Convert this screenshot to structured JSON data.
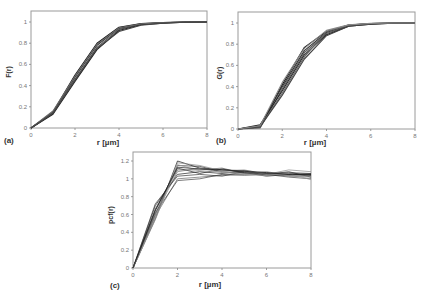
{
  "chart_data": [
    {
      "id": "a",
      "type": "line",
      "panel_label": "(a)",
      "title": "",
      "xlabel": "r [µm]",
      "ylabel": "F(r)",
      "xlim": [
        0,
        8
      ],
      "ylim": [
        0,
        1.1
      ],
      "xticks": [
        0,
        2,
        4,
        6,
        8
      ],
      "yticks": [
        0,
        0.2,
        0.4,
        0.6,
        0.8,
        1
      ],
      "ytick_labels": [
        "0",
        "0.2",
        "0.4",
        "0.6",
        "0.8",
        "1"
      ],
      "grid": false,
      "legend": "none",
      "x": [
        0,
        1,
        2,
        3,
        4,
        5,
        6,
        7,
        8
      ],
      "series": [
        {
          "name": "s1",
          "values": [
            0,
            0.15,
            0.5,
            0.8,
            0.95,
            0.985,
            0.995,
            1,
            1
          ]
        },
        {
          "name": "s2",
          "values": [
            0,
            0.14,
            0.48,
            0.78,
            0.94,
            0.98,
            0.993,
            1,
            1
          ]
        },
        {
          "name": "s3",
          "values": [
            0,
            0.15,
            0.46,
            0.76,
            0.93,
            0.978,
            0.992,
            0.999,
            1
          ]
        },
        {
          "name": "s4",
          "values": [
            0,
            0.13,
            0.44,
            0.74,
            0.92,
            0.975,
            0.99,
            0.998,
            1
          ]
        },
        {
          "name": "s5",
          "values": [
            0,
            0.16,
            0.49,
            0.79,
            0.945,
            0.982,
            0.994,
            1,
            1
          ]
        },
        {
          "name": "s6",
          "values": [
            0,
            0.14,
            0.45,
            0.75,
            0.91,
            0.97,
            0.99,
            0.998,
            1
          ]
        }
      ]
    },
    {
      "id": "b",
      "type": "line",
      "panel_label": "(b)",
      "title": "",
      "xlabel": "r [µm]",
      "ylabel": "G(r)",
      "xlim": [
        0,
        8
      ],
      "ylim": [
        0,
        1.1
      ],
      "xticks": [
        0,
        2,
        4,
        6,
        8
      ],
      "yticks": [
        0,
        0.2,
        0.4,
        0.6,
        0.8,
        1
      ],
      "ytick_labels": [
        "0",
        "0.2",
        "0.4",
        "0.6",
        "0.8",
        "1"
      ],
      "grid": false,
      "legend": "none",
      "x": [
        0,
        1,
        2,
        3,
        4,
        5,
        6,
        7,
        8
      ],
      "series": [
        {
          "name": "s1",
          "values": [
            0,
            0.02,
            0.42,
            0.77,
            0.92,
            0.98,
            0.995,
            1,
            1
          ]
        },
        {
          "name": "s2",
          "values": [
            0,
            0.03,
            0.4,
            0.74,
            0.91,
            0.978,
            0.994,
            1,
            1
          ]
        },
        {
          "name": "s3",
          "values": [
            0,
            0.01,
            0.38,
            0.72,
            0.9,
            0.975,
            0.993,
            0.999,
            1
          ]
        },
        {
          "name": "s4",
          "values": [
            0,
            0.04,
            0.36,
            0.7,
            0.89,
            0.97,
            0.99,
            0.998,
            1
          ]
        },
        {
          "name": "s5",
          "values": [
            0,
            0.02,
            0.34,
            0.68,
            0.92,
            0.98,
            0.995,
            1,
            1
          ]
        },
        {
          "name": "s6",
          "values": [
            0,
            0.02,
            0.32,
            0.66,
            0.88,
            0.97,
            0.99,
            0.998,
            1
          ]
        },
        {
          "name": "s7",
          "values": [
            0,
            0.03,
            0.44,
            0.76,
            0.93,
            0.982,
            0.996,
            1,
            1
          ]
        }
      ]
    },
    {
      "id": "c",
      "type": "line",
      "panel_label": "(c)",
      "title": "",
      "xlabel": "r [µm]",
      "ylabel": "pcf(r)",
      "xlim": [
        0,
        8
      ],
      "ylim": [
        0,
        1.3
      ],
      "xticks": [
        0,
        2,
        4,
        6,
        8
      ],
      "yticks": [
        0,
        0.2,
        0.4,
        0.6,
        0.8,
        1,
        1.2
      ],
      "ytick_labels": [
        "0",
        "0.2",
        "0.4",
        "0.6",
        "0.8",
        "1",
        "1.2"
      ],
      "grid": false,
      "legend": "none",
      "x": [
        0,
        1,
        2,
        3,
        4,
        5,
        6,
        7,
        8
      ],
      "series": [
        {
          "name": "s1",
          "values": [
            0,
            0.55,
            1.2,
            1.12,
            1.1,
            1.08,
            1.06,
            1.05,
            1.04
          ]
        },
        {
          "name": "s2",
          "values": [
            0,
            0.6,
            1.15,
            1.14,
            1.08,
            1.07,
            1.05,
            1.08,
            1.02
          ]
        },
        {
          "name": "s3",
          "values": [
            0,
            0.65,
            1.1,
            1.1,
            1.12,
            1.06,
            1.07,
            1.04,
            1.06
          ]
        },
        {
          "name": "s4",
          "values": [
            0,
            0.7,
            1.05,
            1.08,
            1.06,
            1.09,
            1.04,
            1.06,
            1.05
          ]
        },
        {
          "name": "s5",
          "values": [
            0,
            0.58,
            1.0,
            1.02,
            1.04,
            1.05,
            1.06,
            1.03,
            1.02
          ]
        },
        {
          "name": "s6",
          "values": [
            0,
            0.62,
            0.98,
            1.0,
            1.05,
            1.04,
            1.05,
            1.02,
            1.0
          ]
        },
        {
          "name": "s7",
          "values": [
            0,
            0.56,
            1.18,
            1.15,
            1.09,
            1.1,
            1.05,
            1.1,
            1.08
          ]
        },
        {
          "name": "s8",
          "values": [
            0,
            0.66,
            1.12,
            1.06,
            1.11,
            1.07,
            1.03,
            1.05,
            1.04
          ]
        },
        {
          "name": "s9",
          "values": [
            0,
            0.6,
            1.08,
            1.12,
            1.07,
            1.06,
            1.08,
            1.04,
            1.03
          ]
        },
        {
          "name": "s10",
          "values": [
            0,
            0.72,
            1.03,
            1.05,
            1.03,
            1.08,
            1.06,
            1.07,
            1.06
          ]
        },
        {
          "name": "s11",
          "values": [
            0,
            0.54,
            1.16,
            1.09,
            1.08,
            1.05,
            1.04,
            1.06,
            0.99
          ]
        },
        {
          "name": "s12",
          "values": [
            0,
            0.64,
            1.13,
            1.11,
            1.1,
            1.09,
            1.07,
            1.05,
            1.05
          ]
        }
      ]
    }
  ]
}
